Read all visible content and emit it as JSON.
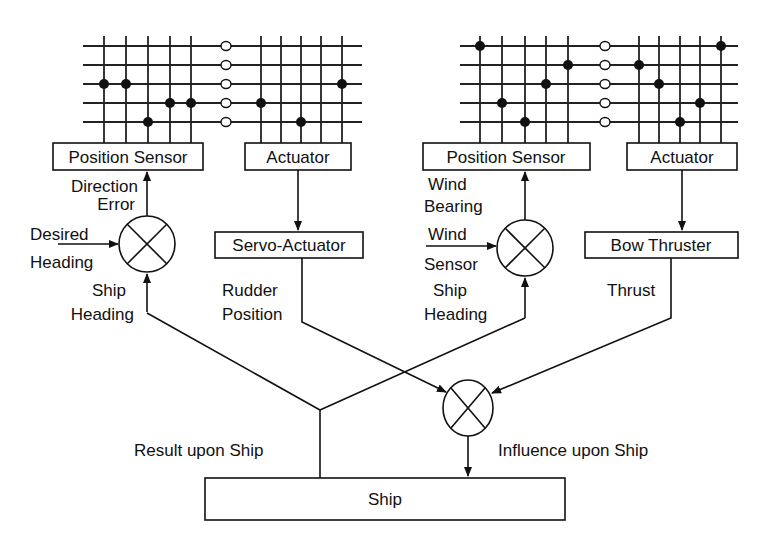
{
  "left_panel": {
    "position_sensor_label": "Position Sensor",
    "actuator_label": "Actuator",
    "servo_label": "Servo-Actuator",
    "direction_error": [
      "Direction",
      "Error"
    ],
    "desired_heading": [
      "Desired",
      "Heading"
    ],
    "ship_heading": [
      "Ship",
      "Heading"
    ],
    "rudder_position": [
      "Rudder",
      "Position"
    ]
  },
  "right_panel": {
    "position_sensor_label": "Position Sensor",
    "actuator_label": "Actuator",
    "bow_thruster_label": "Bow Thruster",
    "wind_bearing": [
      "Wind",
      "Bearing"
    ],
    "wind_sensor": [
      "Wind",
      "Sensor"
    ],
    "ship_heading": [
      "Ship",
      "Heading"
    ],
    "thrust": "Thrust"
  },
  "bottom": {
    "result_label": "Result upon Ship",
    "influence_label": "Influence upon Ship",
    "ship_label": "Ship"
  }
}
